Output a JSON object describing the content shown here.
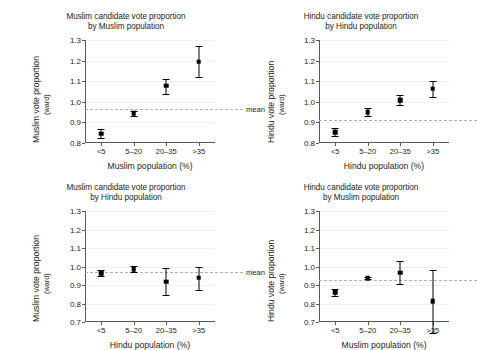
{
  "figure": {
    "background": "#ffffff",
    "marker_color": "#000000",
    "mean_line_color": "#b0b0b0",
    "axis_color": "#58595b",
    "mean_label": "mean"
  },
  "chart_data": [
    {
      "type": "scatter",
      "panel": "top-left",
      "title": "Muslim candidate vote proportion by Muslim population",
      "title_lines": [
        "Muslim candidate vote proportion",
        "by Muslim population"
      ],
      "xlabel": "Muslim population (%)",
      "ylabel": "Muslim vote proportion",
      "ylabel_sub": "(ward)",
      "categories": [
        "<5",
        "5–20",
        "20–35",
        ">35"
      ],
      "values": [
        0.845,
        0.945,
        1.078,
        1.195
      ],
      "err_low": [
        0.822,
        0.933,
        1.04,
        1.118
      ],
      "err_high": [
        0.868,
        0.957,
        1.112,
        1.272
      ],
      "ylim": [
        0.8,
        1.3
      ],
      "yticks": [
        "1.3",
        "1.2",
        "1.1",
        "1.0",
        "0.9",
        "0.8"
      ],
      "ytick_values": [
        1.3,
        1.2,
        1.1,
        1.0,
        0.9,
        0.8
      ],
      "mean": 0.965,
      "grid": true,
      "legend": "none"
    },
    {
      "type": "scatter",
      "panel": "top-right",
      "title": "Hindu candidate vote proportion by Hindu population",
      "title_lines": [
        "Hindu candidate vote proportion",
        "by Hindu population"
      ],
      "xlabel": "Hindu population (%)",
      "ylabel": "Hindu vote proportion",
      "ylabel_sub": "(ward)",
      "categories": [
        "<5",
        "5–20",
        "20–35",
        ">35"
      ],
      "values": [
        0.852,
        0.95,
        1.008,
        1.063
      ],
      "err_low": [
        0.833,
        0.93,
        0.983,
        1.025
      ],
      "err_high": [
        0.871,
        0.97,
        1.033,
        1.101
      ],
      "ylim": [
        0.8,
        1.3
      ],
      "yticks": [
        "1.3",
        "1.2",
        "1.1",
        "1.0",
        "0.9",
        "0.8"
      ],
      "ytick_values": [
        1.3,
        1.2,
        1.1,
        1.0,
        0.9,
        0.8
      ],
      "mean": 0.912,
      "grid": true,
      "legend": "none"
    },
    {
      "type": "scatter",
      "panel": "bottom-left",
      "title": "Muslim candidate vote proportion by Hindu population",
      "title_lines": [
        "Muslim candidate vote proportion",
        "by Hindu population"
      ],
      "xlabel": "Hindu population (%)",
      "ylabel": "Muslim vote proportion",
      "ylabel_sub": "(ward)",
      "categories": [
        "<5",
        "5–20",
        "20–35",
        ">35"
      ],
      "values": [
        0.965,
        0.985,
        0.918,
        0.94
      ],
      "err_low": [
        0.95,
        0.968,
        0.845,
        0.872
      ],
      "err_high": [
        0.98,
        1.002,
        0.992,
        1.0
      ],
      "ylim": [
        0.7,
        1.3
      ],
      "yticks": [
        "1.3",
        "1.2",
        "1.1",
        "1.0",
        "0.9",
        "0.8",
        "0.7"
      ],
      "ytick_values": [
        1.3,
        1.2,
        1.1,
        1.0,
        0.9,
        0.8,
        0.7
      ],
      "mean": 0.968,
      "grid": true,
      "legend": "none"
    },
    {
      "type": "scatter",
      "panel": "bottom-right",
      "title": "Hindu candidate vote proportion by Muslim population",
      "title_lines": [
        "Hindu candidate vote proportion",
        "by Muslim population"
      ],
      "xlabel": "Muslim population (%)",
      "ylabel": "Hindu vote proportion",
      "ylabel_sub": "(ward)",
      "categories": [
        "<5",
        "5–20",
        "20–35",
        ">35"
      ],
      "values": [
        0.86,
        0.937,
        0.967,
        0.812
      ],
      "err_low": [
        0.843,
        0.931,
        0.905,
        0.642
      ],
      "err_high": [
        0.877,
        0.943,
        1.03,
        0.982
      ],
      "ylim": [
        0.7,
        1.3
      ],
      "yticks": [
        "1.3",
        "1.2",
        "1.1",
        "1.0",
        "0.9",
        "0.8",
        "0.7"
      ],
      "ytick_values": [
        1.3,
        1.2,
        1.1,
        1.0,
        0.9,
        0.8,
        0.7
      ],
      "mean": 0.925,
      "grid": true,
      "legend": "none"
    }
  ]
}
